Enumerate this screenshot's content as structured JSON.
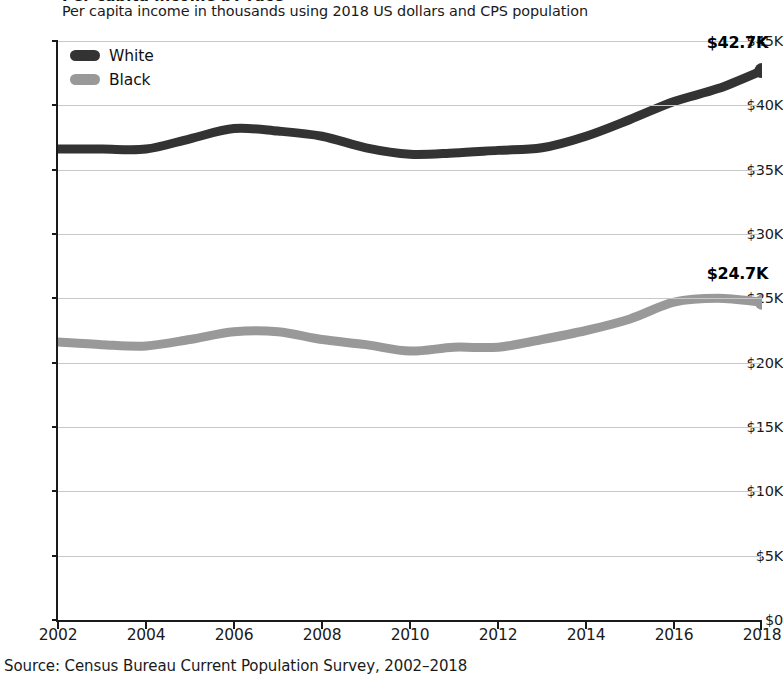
{
  "chart_data": {
    "type": "line",
    "title": "Per capita income by race",
    "subtitle": "Per capita income in thousands using 2018 US dollars and CPS population",
    "xlabel": "",
    "ylabel": "",
    "x": [
      2002,
      2003,
      2004,
      2005,
      2006,
      2007,
      2008,
      2009,
      2010,
      2011,
      2012,
      2013,
      2014,
      2015,
      2016,
      2017,
      2018
    ],
    "xlim": [
      2002,
      2018
    ],
    "ylim": [
      0,
      45
    ],
    "xticks": [
      2002,
      2004,
      2006,
      2008,
      2010,
      2012,
      2014,
      2016,
      2018
    ],
    "xtick_labels": [
      "2002",
      "2004",
      "2006",
      "2008",
      "2010",
      "2012",
      "2014",
      "2016",
      "2018"
    ],
    "yticks": [
      0,
      5,
      10,
      15,
      20,
      25,
      30,
      35,
      40,
      45
    ],
    "ytick_labels": [
      "$0",
      "$5K",
      "$10K",
      "$15K",
      "$20K",
      "$25K",
      "$30K",
      "$35K",
      "$40K",
      "$45K"
    ],
    "grid": true,
    "legend_position": "top-left",
    "series": [
      {
        "name": "White",
        "color": "#333333",
        "values": [
          36.6,
          36.6,
          36.6,
          37.4,
          38.2,
          38.0,
          37.6,
          36.7,
          36.2,
          36.3,
          36.5,
          36.7,
          37.6,
          38.9,
          40.3,
          41.3,
          42.7
        ],
        "end_label": "$42.7K",
        "end_value": 42.7
      },
      {
        "name": "Black",
        "color": "#999999",
        "values": [
          21.6,
          21.4,
          21.3,
          21.8,
          22.4,
          22.4,
          21.8,
          21.4,
          20.9,
          21.2,
          21.2,
          21.8,
          22.5,
          23.4,
          24.7,
          25.0,
          24.7
        ],
        "end_label": "$24.7K",
        "end_value": 24.7
      }
    ],
    "annotations": [
      {
        "text": "$42.7K",
        "series": "White",
        "x": 2018
      },
      {
        "text": "$24.7K",
        "series": "Black",
        "x": 2018
      }
    ]
  },
  "legend": {
    "items": [
      {
        "label": "White",
        "color": "#333333"
      },
      {
        "label": "Black",
        "color": "#999999"
      }
    ]
  },
  "source": {
    "text": "Source: Census Bureau Current Population Survey, 2002–2018"
  }
}
